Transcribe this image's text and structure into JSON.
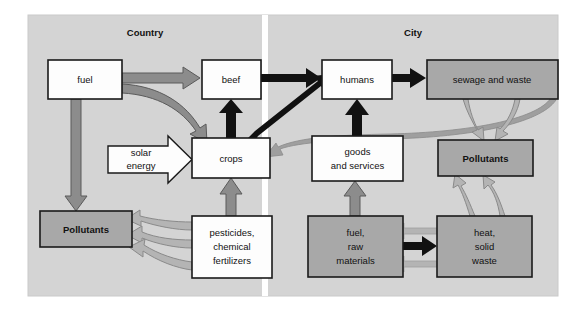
{
  "figure": {
    "type": "flow-diagram",
    "panel": {
      "x": 28,
      "y": 15,
      "width": 530,
      "height": 281,
      "fill": "#d4d4d4"
    },
    "divider": {
      "x": 262,
      "width": 6,
      "color": "#ffffff"
    }
  },
  "sections": [
    {
      "id": "country",
      "label": "Country",
      "cx": 145,
      "cy": 33
    },
    {
      "id": "city",
      "label": "City",
      "cx": 413,
      "cy": 33
    }
  ],
  "colors": {
    "panel_gray": "#d4d4d4",
    "box_white": "#fdfdfd",
    "box_gray": "#a8a8a8",
    "stroke_dark": "#1a1a1a",
    "arrow_black": "#111111",
    "arrow_gray": "#8c8c8c",
    "arrow_light": "#b4b4b4",
    "divider_white": "#ffffff"
  },
  "nodes": [
    {
      "id": "fuel",
      "label": "fuel",
      "lines": [
        "fuel"
      ],
      "x": 48,
      "y": 60,
      "w": 74,
      "h": 39,
      "fill": "#fdfdfd",
      "bold": false,
      "shape": "rect"
    },
    {
      "id": "beef",
      "label": "beef",
      "lines": [
        "beef"
      ],
      "x": 202,
      "y": 60,
      "w": 59,
      "h": 39,
      "fill": "#fdfdfd",
      "bold": false,
      "shape": "rect"
    },
    {
      "id": "humans",
      "label": "humans",
      "lines": [
        "humans"
      ],
      "x": 322,
      "y": 60,
      "w": 70,
      "h": 39,
      "fill": "#fdfdfd",
      "bold": false,
      "shape": "rect"
    },
    {
      "id": "sewage-and-waste",
      "label": "sewage and waste",
      "lines": [
        "sewage and waste"
      ],
      "x": 427,
      "y": 60,
      "w": 131,
      "h": 39,
      "fill": "#a8a8a8",
      "bold": false,
      "shape": "rect"
    },
    {
      "id": "solar-energy",
      "label": "solar energy",
      "lines": [
        "solar",
        "energy"
      ],
      "x": 108,
      "y": 136,
      "w": 84,
      "h": 47,
      "fill": "#fdfdfd",
      "bold": false,
      "shape": "arrow-right"
    },
    {
      "id": "crops",
      "label": "crops",
      "lines": [
        "crops"
      ],
      "x": 192,
      "y": 138,
      "w": 78,
      "h": 40,
      "fill": "#fdfdfd",
      "bold": false,
      "shape": "rect"
    },
    {
      "id": "goods-and-services",
      "label": "goods and services",
      "lines": [
        "goods",
        "and services"
      ],
      "x": 312,
      "y": 136,
      "w": 91,
      "h": 45,
      "fill": "#fdfdfd",
      "bold": false,
      "shape": "rect"
    },
    {
      "id": "pollutants-city",
      "label": "Pollutants",
      "lines": [
        "Pollutants"
      ],
      "x": 438,
      "y": 140,
      "w": 95,
      "h": 36,
      "fill": "#a8a8a8",
      "bold": true,
      "shape": "rect"
    },
    {
      "id": "pollutants-country",
      "label": "Pollutants",
      "lines": [
        "Pollutants"
      ],
      "x": 40,
      "y": 211,
      "w": 92,
      "h": 36,
      "fill": "#a8a8a8",
      "bold": true,
      "shape": "rect"
    },
    {
      "id": "pesticides",
      "label": "pesticides, chemical fertilizers",
      "lines": [
        "pesticides,",
        "chemical",
        "fertilizers"
      ],
      "x": 192,
      "y": 216,
      "w": 80,
      "h": 62,
      "fill": "#fdfdfd",
      "bold": false,
      "shape": "rect"
    },
    {
      "id": "fuel-raw-materials",
      "label": "fuel, raw materials",
      "lines": [
        "fuel,",
        "raw",
        "materials"
      ],
      "x": 308,
      "y": 216,
      "w": 95,
      "h": 61,
      "fill": "#a8a8a8",
      "bold": false,
      "shape": "rect"
    },
    {
      "id": "heat-solid-waste",
      "label": "heat, solid waste",
      "lines": [
        "heat,",
        "solid",
        "waste"
      ],
      "x": 437,
      "y": 216,
      "w": 95,
      "h": 61,
      "fill": "#a8a8a8",
      "bold": false,
      "shape": "rect"
    }
  ],
  "flows": [
    {
      "id": "fuel-to-beef",
      "from": "fuel",
      "to": "beef",
      "style": "gray-thick"
    },
    {
      "id": "fuel-to-crops",
      "from": "fuel",
      "to": "crops",
      "style": "gray-curved"
    },
    {
      "id": "fuel-to-pollutants-country",
      "from": "fuel",
      "to": "pollutants-country",
      "style": "gray-thick"
    },
    {
      "id": "solar-energy-to-crops",
      "from": "solar-energy",
      "to": "crops",
      "style": "white-block-arrow"
    },
    {
      "id": "crops-to-beef",
      "from": "crops",
      "to": "beef",
      "style": "black-thick"
    },
    {
      "id": "crops-to-humans",
      "from": "crops",
      "to": "humans",
      "style": "black-thick"
    },
    {
      "id": "beef-to-humans",
      "from": "beef",
      "to": "humans",
      "style": "black-thick"
    },
    {
      "id": "humans-to-sewage",
      "from": "humans",
      "to": "sewage-and-waste",
      "style": "black-thick"
    },
    {
      "id": "humans-to-crops-return",
      "from": "humans",
      "to": "crops",
      "style": "gray-curved-long"
    },
    {
      "id": "sewage-to-pollutants-city",
      "from": "sewage-and-waste",
      "to": "pollutants-city",
      "style": "gray-double-curve"
    },
    {
      "id": "goods-to-humans",
      "from": "goods-and-services",
      "to": "humans",
      "style": "black-thick"
    },
    {
      "id": "fuel-raw-to-goods",
      "from": "fuel-raw-materials",
      "to": "goods-and-services",
      "style": "gray-thick"
    },
    {
      "id": "fuel-raw-to-heat",
      "from": "fuel-raw-materials",
      "to": "heat-solid-waste",
      "style": "black-thick"
    },
    {
      "id": "heat-to-fuel-raw-upper",
      "from": "heat-solid-waste",
      "to": "fuel-raw-materials",
      "style": "gray-thick"
    },
    {
      "id": "heat-to-fuel-raw-lower",
      "from": "heat-solid-waste",
      "to": "fuel-raw-materials",
      "style": "gray-thick"
    },
    {
      "id": "heat-to-pollutants-city",
      "from": "heat-solid-waste",
      "to": "pollutants-city",
      "style": "gray-double-curve"
    },
    {
      "id": "pesticides-to-crops",
      "from": "pesticides",
      "to": "crops",
      "style": "gray-thick"
    },
    {
      "id": "pesticides-to-pollutants-1",
      "from": "pesticides",
      "to": "pollutants-country",
      "style": "gray-curved"
    },
    {
      "id": "pesticides-to-pollutants-2",
      "from": "pesticides",
      "to": "pollutants-country",
      "style": "gray-curved"
    },
    {
      "id": "pesticides-to-pollutants-3",
      "from": "pesticides",
      "to": "pollutants-country",
      "style": "gray-curved"
    }
  ]
}
